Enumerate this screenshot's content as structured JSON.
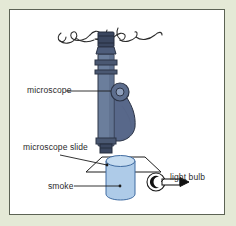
{
  "figure": {
    "frame": {
      "background_color": "#e4e9d6",
      "panel_color": "#ffffff",
      "border_color": "#5c6354"
    },
    "labels": [
      {
        "id": "microscope",
        "text": "microscope"
      },
      {
        "id": "slide",
        "text": "microscope slide"
      },
      {
        "id": "smoke",
        "text": "smoke"
      },
      {
        "id": "light_bulb",
        "text": "light bulb"
      }
    ],
    "parts": {
      "microscope": {
        "name": "microscope",
        "body_color": "#6b7e9c",
        "body_shade_color": "#58688a",
        "dark_color": "#3b4760",
        "outline_color": "#2c3446",
        "components": [
          "eyepiece",
          "draw-tube",
          "body-tube",
          "focus-knob",
          "arm",
          "objective"
        ]
      },
      "microscope_slide": {
        "name": "microscope slide",
        "stroke_color": "#1d1d1d",
        "fill": "none",
        "shape": "parallelogram"
      },
      "smoke_cell": {
        "name": "smoke cell",
        "fill_color": "#aecbe8",
        "top_fill_color": "#c6dcf0",
        "stroke_color": "#3f6ba1",
        "shape": "cylinder"
      },
      "light_bulb": {
        "name": "light bulb",
        "glass_stroke_color": "#1d1d1d",
        "filament_color": "#111111",
        "stem_color": "#111111"
      },
      "annotation_scribble": {
        "name": "handwritten annotation",
        "stroke_color": "#2b2b2b",
        "description": "hand-drawn squiggle above eyepiece"
      }
    }
  }
}
